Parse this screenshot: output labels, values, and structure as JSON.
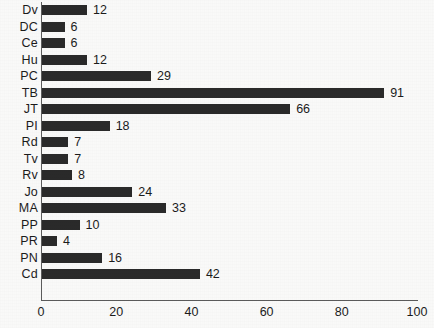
{
  "chart_data": {
    "type": "bar",
    "orientation": "horizontal",
    "title": "",
    "xlabel": "",
    "ylabel": "",
    "xlim": [
      0,
      100
    ],
    "grid": false,
    "legend": null,
    "xticks": [
      0,
      20,
      40,
      60,
      80,
      100
    ],
    "categories": [
      "Dv",
      "DC",
      "Ce",
      "Hu",
      "PC",
      "TB",
      "JT",
      "PI",
      "Rd",
      "Tv",
      "Rv",
      "Jo",
      "MA",
      "PP",
      "PR",
      "PN",
      "Cd"
    ],
    "values": [
      12,
      6,
      6,
      12,
      29,
      91,
      66,
      18,
      7,
      7,
      8,
      24,
      33,
      10,
      4,
      16,
      42
    ],
    "bar_color": "#2b2b2b",
    "axis_color": "#5d5d5d"
  }
}
